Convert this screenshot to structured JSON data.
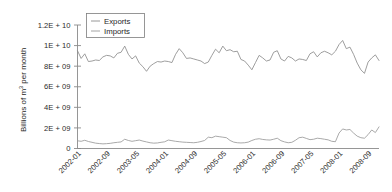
{
  "chart_data": {
    "type": "line",
    "title": "",
    "xlabel": "",
    "ylabel": "Billions of m3 per month",
    "ylabel_prefix": "Billions of m",
    "ylabel_exponent": "3",
    "ylabel_suffix": " per month",
    "grid": false,
    "legend_position": "top-left",
    "ylim": [
      0,
      12000000000
    ],
    "ytick_values": [
      0,
      2000000000,
      4000000000,
      6000000000,
      8000000000,
      10000000000,
      12000000000
    ],
    "ytick_labels": [
      "0",
      "2E + 09",
      "4E + 09",
      "6E + 09",
      "8E + 09",
      "1E + 10",
      "1.2E + 10"
    ],
    "xtick_labels": [
      "2002-01",
      "2002-09",
      "2003-05",
      "2004-01",
      "2004-09",
      "2005-05",
      "2006-01",
      "2006-09",
      "2007-05",
      "2008-01",
      "2008-09"
    ],
    "xtick_indices": [
      0,
      8,
      16,
      24,
      32,
      40,
      48,
      56,
      64,
      72,
      80
    ],
    "x_start": "2002-01",
    "x_end": "2008-12",
    "n_points": 84,
    "colors": {
      "exports": "#8d8d8d",
      "imports": "#9a9a9a",
      "axis": "#8a8a8a",
      "text": "#1f1f1f",
      "background": "#ffffff"
    },
    "series": [
      {
        "name": "Exports",
        "color": "#8d8d8d",
        "values": [
          9500000000,
          8750000000,
          9200000000,
          8450000000,
          8500000000,
          8600000000,
          8550000000,
          8900000000,
          9050000000,
          9000000000,
          8800000000,
          9250000000,
          9350000000,
          9950000000,
          9150000000,
          8700000000,
          9000000000,
          8300000000,
          7950000000,
          7500000000,
          8000000000,
          8250000000,
          8450000000,
          8400000000,
          8500000000,
          8450000000,
          8350000000,
          9150000000,
          9700000000,
          9300000000,
          8750000000,
          8800000000,
          8700000000,
          8600000000,
          8500000000,
          8250000000,
          8400000000,
          9050000000,
          9650000000,
          9300000000,
          9950000000,
          9500000000,
          9600000000,
          9400000000,
          9450000000,
          8650000000,
          8500000000,
          8100000000,
          7650000000,
          8350000000,
          9050000000,
          8800000000,
          8500000000,
          8600000000,
          9350000000,
          9500000000,
          8700000000,
          8500000000,
          8950000000,
          8800000000,
          8500000000,
          8700000000,
          8650000000,
          8550000000,
          9200000000,
          9400000000,
          8900000000,
          9300000000,
          9450000000,
          9300000000,
          9100000000,
          9450000000,
          10100000000,
          10500000000,
          9700000000,
          9850000000,
          9150000000,
          8300000000,
          7650000000,
          7300000000,
          8400000000,
          8800000000,
          9100000000,
          8550000000
        ]
      },
      {
        "name": "Imports",
        "color": "#9a9a9a",
        "values": [
          750000000,
          700000000,
          800000000,
          680000000,
          600000000,
          520000000,
          480000000,
          450000000,
          470000000,
          500000000,
          560000000,
          600000000,
          640000000,
          900000000,
          780000000,
          700000000,
          760000000,
          820000000,
          720000000,
          640000000,
          560000000,
          520000000,
          540000000,
          600000000,
          650000000,
          820000000,
          760000000,
          700000000,
          660000000,
          620000000,
          600000000,
          580000000,
          560000000,
          600000000,
          680000000,
          780000000,
          1100000000,
          1050000000,
          1200000000,
          1150000000,
          1100000000,
          1050000000,
          780000000,
          620000000,
          560000000,
          540000000,
          560000000,
          620000000,
          780000000,
          900000000,
          950000000,
          880000000,
          840000000,
          820000000,
          900000000,
          1000000000,
          760000000,
          640000000,
          560000000,
          600000000,
          800000000,
          1050000000,
          1100000000,
          980000000,
          860000000,
          900000000,
          1000000000,
          960000000,
          900000000,
          840000000,
          700000000,
          660000000,
          1500000000,
          1900000000,
          1800000000,
          1850000000,
          1500000000,
          1200000000,
          1050000000,
          1000000000,
          1350000000,
          1800000000,
          1550000000,
          2100000000
        ]
      }
    ]
  },
  "legend": {
    "entries": [
      {
        "label": "Exports"
      },
      {
        "label": "Imports"
      }
    ]
  }
}
